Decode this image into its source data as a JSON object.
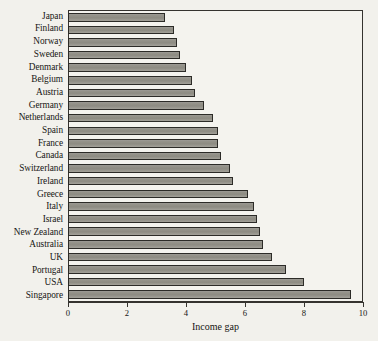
{
  "chart_data": {
    "type": "bar",
    "orientation": "horizontal",
    "title": "",
    "xlabel": "Income gap",
    "ylabel": "",
    "xlim": [
      0,
      10
    ],
    "ylim": null,
    "grid": false,
    "legend": null,
    "xticks": [
      "0",
      "2",
      "4",
      "6",
      "8",
      "10"
    ],
    "xtick_values": [
      0,
      2,
      4,
      6,
      8,
      10
    ],
    "categories": [
      "Japan",
      "Finland",
      "Norway",
      "Sweden",
      "Denmark",
      "Belgium",
      "Austria",
      "Germany",
      "Netherlands",
      "Spain",
      "France",
      "Canada",
      "Switzerland",
      "Ireland",
      "Greece",
      "Italy",
      "Israel",
      "New Zealand",
      "Australia",
      "UK",
      "Portugal",
      "USA",
      "Singapore"
    ],
    "values": [
      3.3,
      3.6,
      3.7,
      3.8,
      4.0,
      4.2,
      4.3,
      4.6,
      4.9,
      5.1,
      5.1,
      5.2,
      5.5,
      5.6,
      6.1,
      6.3,
      6.4,
      6.5,
      6.6,
      6.9,
      7.4,
      8.0,
      9.6
    ],
    "series": [
      {
        "name": "Income gap",
        "values": [
          3.3,
          3.6,
          3.7,
          3.8,
          4.0,
          4.2,
          4.3,
          4.6,
          4.9,
          5.1,
          5.1,
          5.2,
          5.5,
          5.6,
          6.1,
          6.3,
          6.4,
          6.5,
          6.6,
          6.9,
          7.4,
          8.0,
          9.6
        ]
      }
    ],
    "bar_fill_color": "#94928a",
    "bar_edge_color": "#2c2b27",
    "background_color": "#f2f1ec",
    "axis_color": "#35332f"
  }
}
